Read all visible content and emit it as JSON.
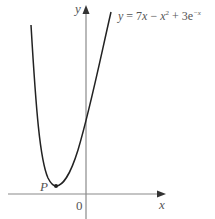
{
  "figure": {
    "equation_label": {
      "prefix": "y",
      "equals": " = 7",
      "x1": "x",
      "minus": " − ",
      "x2": "x",
      "sq": "2",
      "plus": " + 3e",
      "exp": "−x"
    },
    "y_axis_label": "y",
    "x_axis_label": "x",
    "origin_label": "0",
    "point_label": "P",
    "colors": {
      "curve": "#222222",
      "axes": "#888888",
      "text": "#555555"
    }
  }
}
